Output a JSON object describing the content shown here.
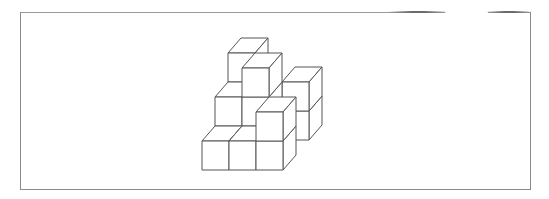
{
  "figure": {
    "type": "isometric cube stack",
    "cube_count": 10,
    "line_color": "#555555",
    "background": "#ffffff",
    "frame_color": "#8a8a8a"
  },
  "cubes": [
    {
      "x": 0,
      "level": 0,
      "z": 0
    },
    {
      "x": 1,
      "level": 0,
      "z": 0
    },
    {
      "x": 2,
      "level": 0,
      "z": 0
    },
    {
      "x": 2,
      "level": 0,
      "z": 2
    },
    {
      "x": 2,
      "level": 1,
      "z": 2
    },
    {
      "x": 0,
      "level": 1,
      "z": 1
    },
    {
      "x": 1,
      "level": 1,
      "z": 1
    },
    {
      "x": 2,
      "level": 1,
      "z": 0
    },
    {
      "x": 0,
      "level": 2,
      "z": 2
    },
    {
      "x": 1,
      "level": 2,
      "z": 1
    }
  ],
  "projection": {
    "origin_x": 202,
    "origin_y": 170,
    "w": 27,
    "h": 29,
    "dx": 13,
    "dy": -15
  }
}
